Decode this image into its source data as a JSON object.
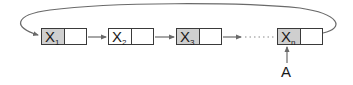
{
  "diagram": {
    "type": "circular-singly-linked-list",
    "colors": {
      "line": "#6a6a6a",
      "border": "#3a3a3a",
      "data_cell_fill": "#cfcfcf",
      "pointer_cell_fill": "#ffffff"
    },
    "nodes": [
      {
        "label": "X",
        "sub": "1"
      },
      {
        "label": "X",
        "sub": "2"
      },
      {
        "label": "X",
        "sub": "3"
      },
      {
        "label": "X",
        "sub": "n"
      }
    ],
    "ellipsis_between": [
      "X3",
      "Xn"
    ],
    "back_link": {
      "from": "Xn",
      "to": "X1"
    },
    "external_pointer": {
      "label": "A",
      "points_to": "Xn"
    }
  }
}
